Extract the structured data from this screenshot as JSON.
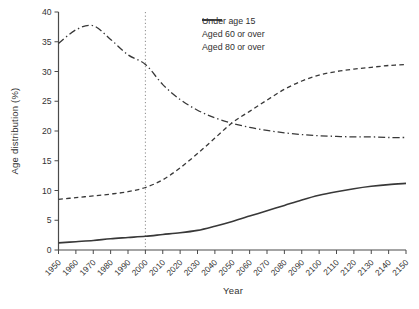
{
  "figure": {
    "background": "#ffffff",
    "line_color": "#383838",
    "axis_color": "#4a4a4a",
    "tick_text_color": "#333333",
    "reference_line_color": "#8a8a8a"
  },
  "chart_data": {
    "type": "line",
    "title": "",
    "xlabel": "Year",
    "ylabel": "Age distribution (%)",
    "x": [
      1950,
      1960,
      1970,
      1980,
      1990,
      2000,
      2010,
      2020,
      2030,
      2040,
      2050,
      2060,
      2070,
      2080,
      2090,
      2100,
      2110,
      2120,
      2130,
      2140,
      2150
    ],
    "xlim": [
      1950,
      2150
    ],
    "ylim": [
      0,
      40
    ],
    "yticks": [
      0,
      5,
      10,
      15,
      20,
      25,
      30,
      35,
      40
    ],
    "xtick_rotation": 45,
    "grid": false,
    "legend_position": "top-right",
    "reference_line": {
      "axis": "x",
      "value": 2000,
      "style": "dotted"
    },
    "series": [
      {
        "name": "Under age 15",
        "style": "dashdot",
        "values": [
          34.7,
          37.0,
          37.7,
          35.4,
          32.8,
          31.2,
          27.8,
          25.3,
          23.5,
          22.2,
          21.3,
          20.6,
          20.1,
          19.7,
          19.4,
          19.2,
          19.1,
          19.0,
          19.0,
          18.9,
          18.9
        ]
      },
      {
        "name": "Aged 60 or over",
        "style": "dashed",
        "values": [
          8.5,
          8.8,
          9.1,
          9.4,
          9.8,
          10.5,
          11.8,
          13.8,
          16.2,
          18.8,
          21.4,
          23.3,
          25.2,
          27.0,
          28.4,
          29.4,
          30.0,
          30.4,
          30.7,
          31.0,
          31.2
        ]
      },
      {
        "name": "Aged 80 or over",
        "style": "solid",
        "values": [
          1.2,
          1.4,
          1.6,
          1.9,
          2.1,
          2.3,
          2.6,
          2.9,
          3.3,
          4.0,
          4.8,
          5.7,
          6.6,
          7.5,
          8.4,
          9.2,
          9.8,
          10.3,
          10.7,
          11.0,
          11.2
        ]
      }
    ]
  }
}
